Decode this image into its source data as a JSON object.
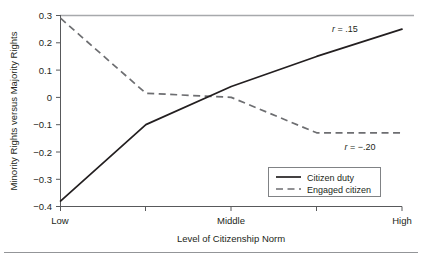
{
  "chart_data": {
    "type": "line",
    "title": "",
    "xlabel": "Level of Citizenship Norm",
    "ylabel": "Minority Rights versus Majority Rights",
    "categories": [
      "Low",
      "",
      "Middle",
      "",
      "High"
    ],
    "x_tick_labels": [
      "Low",
      "Middle",
      "High"
    ],
    "y_tick_labels": [
      "0.3",
      "0.2",
      "0.1",
      "0",
      "−0.1",
      "−0.2",
      "−0.3",
      "−0.4"
    ],
    "y_tick_values": [
      0.3,
      0.2,
      0.1,
      0,
      -0.1,
      -0.2,
      -0.3,
      -0.4
    ],
    "ylim": [
      -0.4,
      0.3
    ],
    "xlim": [
      0,
      4
    ],
    "x": [
      0,
      1,
      2,
      3,
      4
    ],
    "grid": false,
    "legend_position": "bottom-right",
    "series": [
      {
        "name": "Citizen duty",
        "style": "solid",
        "color": "#231f20",
        "values": [
          -0.38,
          -0.1,
          0.04,
          0.15,
          0.25
        ]
      },
      {
        "name": "Engaged citizen",
        "style": "dashed",
        "color": "#6d6e71",
        "values": [
          0.29,
          0.015,
          0.0,
          -0.13,
          -0.13
        ]
      }
    ],
    "annotations": [
      {
        "text_prefix": "r",
        "text_suffix": " = .15",
        "series": "Citizen duty",
        "value": 0.15
      },
      {
        "text_prefix": "r",
        "text_suffix": " = −.20",
        "series": "Engaged citizen",
        "value": -0.2
      }
    ]
  },
  "axes": {
    "y_title": "Minority Rights versus Majority Rights",
    "x_title": "Level of Citizenship Norm",
    "y_ticks": {
      "t0": "0.3",
      "t1": "0.2",
      "t2": "0.1",
      "t3": "0",
      "t4": "−0.1",
      "t5": "−0.2",
      "t6": "−0.3",
      "t7": "−0.4"
    },
    "x_ticks": {
      "low": "Low",
      "middle": "Middle",
      "high": "High"
    }
  },
  "legend": {
    "items": {
      "citizen_duty": "Citizen duty",
      "engaged_citizen": "Engaged citizen"
    }
  },
  "annotations": {
    "r_solid": {
      "symbol": "r",
      "rest": " = .15"
    },
    "r_dashed": {
      "symbol": "r",
      "rest": " = −.20"
    }
  }
}
